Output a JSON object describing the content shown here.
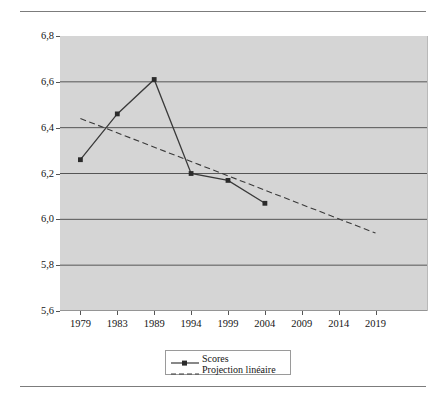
{
  "figure": {
    "top_caption": "",
    "background_color": "#ffffff",
    "plot_background_color": "#d5d5d5",
    "gridline_color": "#555555",
    "series_color": "#3a3a3a"
  },
  "legend": {
    "position": "bottom-center",
    "entries": [
      {
        "label": "Scores",
        "style": "solid-with-square-marker"
      },
      {
        "label": "Projection linéaire",
        "style": "dashed"
      }
    ]
  },
  "chart_data": {
    "type": "line",
    "title": "",
    "subtitle": "",
    "xlabel": "",
    "ylabel": "",
    "categories": [
      "1979",
      "1983",
      "1989",
      "1994",
      "1999",
      "2004",
      "2009",
      "2014",
      "2019"
    ],
    "ylim": [
      5.6,
      6.8
    ],
    "yticks": [
      "5,6",
      "5,8",
      "6,0",
      "6,2",
      "6,4",
      "6,6",
      "6,8"
    ],
    "ytick_values": [
      5.6,
      5.8,
      6.0,
      6.2,
      6.4,
      6.6,
      6.8
    ],
    "grid": "horizontal",
    "legend_position": "bottom",
    "series": [
      {
        "name": "Scores",
        "style": "solid",
        "marker": "square",
        "x": [
          "1979",
          "1983",
          "1989",
          "1994",
          "1999",
          "2004"
        ],
        "values": [
          6.26,
          6.46,
          6.61,
          6.2,
          6.17,
          6.07
        ]
      },
      {
        "name": "Projection linéaire",
        "style": "dashed",
        "marker": "none",
        "x": [
          "1979",
          "2019"
        ],
        "values": [
          6.44,
          5.94
        ]
      }
    ]
  }
}
